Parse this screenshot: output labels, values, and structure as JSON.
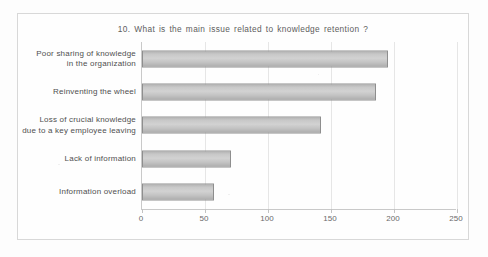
{
  "chart_data": {
    "type": "bar",
    "orientation": "horizontal",
    "title": "10. What is the main issue related to knowledge retention ?",
    "categories": [
      "Poor sharing of knowledge in the organization",
      "Reinventing the wheel",
      "Loss of crucial knowledge due to a key employee leaving",
      "Lack of information",
      "Information overload"
    ],
    "category_lines": [
      [
        "Poor sharing of knowledge",
        "in the organization"
      ],
      [
        "Reinventing the wheel"
      ],
      [
        "Loss of crucial knowledge",
        "due to a key employee leaving"
      ],
      [
        "Lack of information"
      ],
      [
        "Information overload"
      ]
    ],
    "values": [
      195,
      186,
      142,
      71,
      57
    ],
    "xlabel": "",
    "ylabel": "",
    "xlim": [
      0,
      250
    ],
    "xticks": [
      0,
      50,
      100,
      150,
      200,
      250
    ],
    "xtick_labels": [
      "0",
      "50",
      "100",
      "150",
      "200",
      "250"
    ],
    "grid": true,
    "grid_axis": "x",
    "legend": false,
    "bar_color": "#c8c8c8",
    "bar_border_color": "#8e8e8e",
    "gridline_color": "#e6e6e6",
    "frame_border_color": "#d8d8d8",
    "text_color": "#4f4f4f"
  }
}
